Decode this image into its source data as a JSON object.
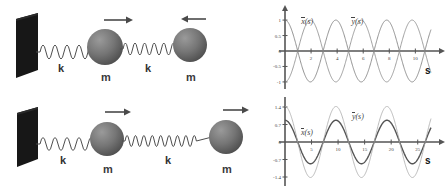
{
  "figure": {
    "left_diagrams": [
      {
        "id": "two-mass-antisymmetric",
        "wall": "fixed-wall",
        "springs": [
          {
            "label": "k",
            "coils": 9
          },
          {
            "label": "k",
            "coils": 11
          }
        ],
        "masses": [
          {
            "label": "m",
            "arrow": "right"
          },
          {
            "label": "m",
            "arrow": "left"
          }
        ]
      },
      {
        "id": "two-mass-symmetric",
        "wall": "fixed-wall",
        "springs": [
          {
            "label": "k",
            "coils": 8
          },
          {
            "label": "k",
            "coils": 17
          }
        ],
        "masses": [
          {
            "label": "m",
            "arrow": "right"
          },
          {
            "label": "m",
            "arrow": "right"
          }
        ]
      }
    ]
  },
  "chart_data": [
    {
      "type": "line",
      "id": "mode-1-plot",
      "title": "",
      "xlabel": "s",
      "ylabel": "",
      "xlim": [
        0,
        11.2
      ],
      "ylim": [
        -1.1,
        1.1
      ],
      "xticks": [
        2,
        4,
        6,
        8,
        10
      ],
      "yticks": [
        1,
        0.5,
        0,
        -0.5,
        -1
      ],
      "xtick_labels": [
        "2",
        "4",
        "6",
        "8",
        "10"
      ],
      "ytick_labels": [
        "1",
        "0.5",
        "0",
        "-0.5",
        "-1"
      ],
      "grid": false,
      "legend_position": "inline-annotation",
      "series": [
        {
          "name": "x(s)",
          "label": "x̄(s)",
          "color": "#777777",
          "linewidth": 0.8,
          "amplitude": 1.0,
          "period": 3.9,
          "phase_deg": 90,
          "label_x": 1.25,
          "label_y": 0.97
        },
        {
          "name": "y(s)",
          "label": "ȳ(s)",
          "color": "#888888",
          "linewidth": 0.8,
          "amplitude": 1.0,
          "period": 3.9,
          "phase_deg": -90,
          "label_x": 5.1,
          "label_y": 0.97
        }
      ]
    },
    {
      "type": "line",
      "id": "mode-2-plot",
      "title": "",
      "xlabel": "s",
      "ylabel": "",
      "xlim": [
        0,
        27.5
      ],
      "ylim": [
        -1.6,
        1.6
      ],
      "xticks": [
        5,
        10,
        15,
        20,
        25
      ],
      "yticks": [
        1.4,
        0.7,
        0,
        -0.7,
        -1.4
      ],
      "xtick_labels": [
        "5",
        "10",
        "15",
        "20",
        "25"
      ],
      "ytick_labels": [
        "1.4",
        "0.7",
        "0",
        "-0.7",
        "-1.4"
      ],
      "grid": false,
      "legend_position": "inline-annotation",
      "series": [
        {
          "name": "x(s)",
          "label": "x̄(s)",
          "color": "#555555",
          "linewidth": 1.4,
          "amplitude": 0.87,
          "period": 9.6,
          "phase_deg": 90,
          "label_x": 3.0,
          "label_y": 0.42
        },
        {
          "name": "y(s)",
          "label": "ȳ(s)",
          "color": "#aaaaaa",
          "linewidth": 0.8,
          "amplitude": 1.42,
          "period": 9.6,
          "phase_deg": 90,
          "label_x": 12.6,
          "label_y": 1.06
        }
      ]
    }
  ],
  "colors": {
    "wall": "#1a1a1a",
    "mass": "#6f6f6f",
    "spring": "#555555",
    "arrow": "#4a4a4a",
    "axis": "#555555",
    "label_text": "#3a3a3a",
    "background": "#ffffff"
  },
  "labels": {
    "spring_k": "k",
    "mass_m": "m",
    "axis_s": "s"
  }
}
